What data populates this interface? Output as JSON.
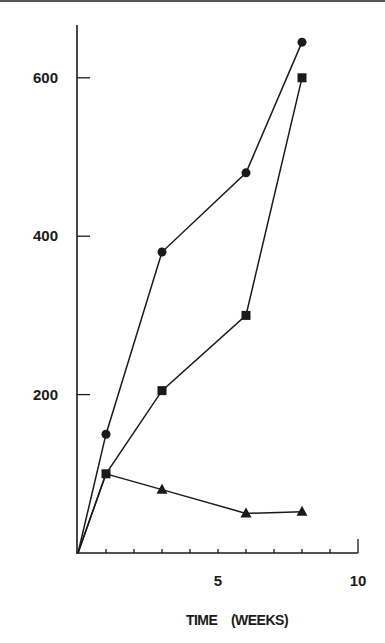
{
  "chart_data": {
    "type": "line",
    "title": "",
    "xlabel": "TIME    (WEEKS)",
    "ylabel": "",
    "xlim": [
      0,
      10
    ],
    "ylim": [
      0,
      660
    ],
    "x_ticks": [
      0,
      1,
      2,
      3,
      4,
      5,
      6,
      7,
      8,
      9,
      10
    ],
    "x_tick_labels": [
      {
        "value": 5,
        "label": "5"
      },
      {
        "value": 10,
        "label": "10"
      }
    ],
    "y_ticks": [
      200,
      400,
      600
    ],
    "y_tick_labels": [
      {
        "value": 200,
        "label": "200"
      },
      {
        "value": 400,
        "label": "400"
      },
      {
        "value": 600,
        "label": "600"
      }
    ],
    "grid": false,
    "legend": null,
    "series": [
      {
        "name": "circle",
        "marker": "circle",
        "x": [
          0,
          1,
          3,
          6,
          8
        ],
        "values": [
          0,
          150,
          380,
          480,
          645
        ]
      },
      {
        "name": "square",
        "marker": "square",
        "x": [
          0,
          1,
          3,
          6,
          8
        ],
        "values": [
          0,
          100,
          205,
          300,
          600
        ]
      },
      {
        "name": "triangle",
        "marker": "triangle",
        "x": [
          0,
          1,
          3,
          6,
          8
        ],
        "values": [
          0,
          100,
          80,
          50,
          52
        ]
      }
    ]
  },
  "colors": {
    "ink": "#1a1a1a",
    "border": "#555555",
    "background": "#ffffff"
  }
}
